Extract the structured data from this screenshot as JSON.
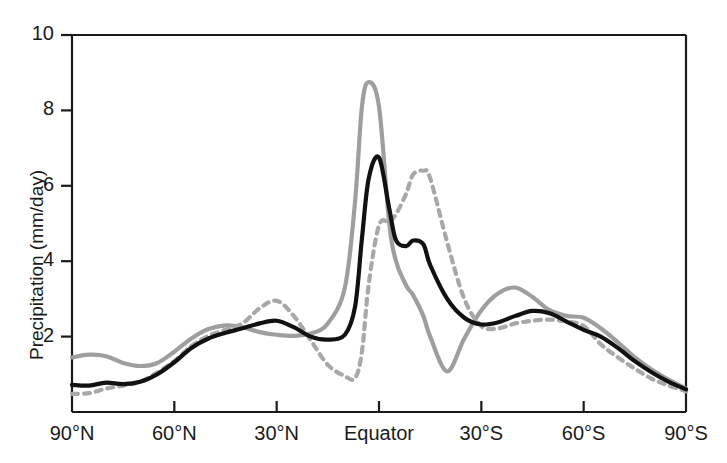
{
  "chart_data": {
    "type": "line",
    "title": "",
    "xlabel": "",
    "ylabel": "Precipitation (mm/day)",
    "xlim": [
      90,
      -90
    ],
    "ylim": [
      0,
      10
    ],
    "grid": false,
    "legend": "none",
    "x_tick_labels": [
      "90°N",
      "60°N",
      "30°N",
      "Equator",
      "30°S",
      "60°S",
      "90°S"
    ],
    "x_tick_values": [
      90,
      60,
      30,
      0,
      -30,
      -60,
      -90
    ],
    "y_tick_labels": [
      "2",
      "4",
      "6",
      "8",
      "10"
    ],
    "y_tick_values": [
      2,
      4,
      6,
      8,
      10
    ],
    "x": [
      90,
      85,
      80,
      75,
      70,
      65,
      60,
      55,
      50,
      45,
      40,
      35,
      30,
      25,
      20,
      15,
      10,
      7,
      5,
      3,
      0,
      -3,
      -5,
      -8,
      -10,
      -13,
      -15,
      -20,
      -25,
      -30,
      -35,
      -40,
      -45,
      -50,
      -55,
      -60,
      -65,
      -70,
      -75,
      -80,
      -85,
      -90
    ],
    "series": [
      {
        "name": "solid-black-curve",
        "style": "solid",
        "color": "#111111",
        "width": 4.2,
        "values": [
          0.72,
          0.7,
          0.78,
          0.74,
          0.8,
          1.0,
          1.32,
          1.7,
          1.95,
          2.1,
          2.22,
          2.35,
          2.42,
          2.25,
          2.0,
          1.92,
          2.05,
          2.8,
          4.6,
          6.2,
          6.75,
          5.4,
          4.55,
          4.4,
          4.55,
          4.45,
          3.9,
          3.0,
          2.5,
          2.32,
          2.38,
          2.55,
          2.68,
          2.62,
          2.4,
          2.18,
          2.0,
          1.7,
          1.35,
          1.05,
          0.8,
          0.6
        ]
      },
      {
        "name": "solid-gray-curve",
        "style": "solid",
        "color": "#9e9e9e",
        "width": 4.2,
        "values": [
          1.45,
          1.52,
          1.48,
          1.3,
          1.22,
          1.3,
          1.6,
          1.95,
          2.2,
          2.3,
          2.25,
          2.12,
          2.05,
          2.02,
          2.08,
          2.35,
          3.3,
          5.6,
          8.1,
          8.75,
          8.1,
          5.0,
          4.0,
          3.35,
          3.1,
          2.55,
          2.0,
          1.08,
          1.95,
          2.7,
          3.15,
          3.3,
          3.05,
          2.7,
          2.55,
          2.5,
          2.22,
          1.85,
          1.45,
          1.12,
          0.85,
          0.62
        ]
      },
      {
        "name": "dashed-gray-curve",
        "style": "dashed",
        "color": "#a8a8a8",
        "width": 4.2,
        "values": [
          0.48,
          0.5,
          0.62,
          0.7,
          0.8,
          1.05,
          1.35,
          1.75,
          2.02,
          2.18,
          2.35,
          2.75,
          2.95,
          2.55,
          1.9,
          1.25,
          0.95,
          0.9,
          1.6,
          3.4,
          4.95,
          5.05,
          5.25,
          5.8,
          6.3,
          6.4,
          6.2,
          4.5,
          3.0,
          2.28,
          2.22,
          2.35,
          2.42,
          2.45,
          2.4,
          2.28,
          1.8,
          1.45,
          1.15,
          0.88,
          0.7,
          0.55
        ]
      }
    ]
  },
  "axes": {
    "y_axis_label": "Precipitation (mm/day)"
  },
  "geometry": {
    "left": 72,
    "right": 686,
    "top": 35,
    "bottom": 412
  }
}
